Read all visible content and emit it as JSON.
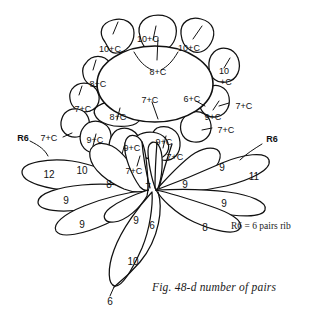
{
  "figure": {
    "caption": "Fig. 48-d number of pairs",
    "legend_note": "R6 = 6 pairs rib",
    "background_color": "#ffffff",
    "ink_color": "#111111"
  },
  "diagram": {
    "center_disc": {
      "labels": [
        {
          "id": "center-top",
          "text": "8+C"
        },
        {
          "id": "center-left-low",
          "text": "7+C"
        },
        {
          "id": "center-right-low",
          "text": "6+C"
        }
      ]
    },
    "outer_petals": [
      {
        "id": "petal-top-left",
        "text": "10+C"
      },
      {
        "id": "petal-top-center",
        "text": "10+C"
      },
      {
        "id": "petal-top-right",
        "text": "10+C"
      },
      {
        "id": "petal-right-upper",
        "text": "10\n+C"
      },
      {
        "id": "petal-left-upper",
        "text": "8+C"
      },
      {
        "id": "petal-left-mid",
        "text": "7+C"
      },
      {
        "id": "petal-left-lower",
        "text": "8+C"
      },
      {
        "id": "petal-left-edge",
        "text": "7+C"
      },
      {
        "id": "petal-bottom-left",
        "text": "9+C"
      },
      {
        "id": "petal-bottom-center-left",
        "text": "9+C"
      },
      {
        "id": "petal-bottom-center",
        "text": "7+C"
      },
      {
        "id": "petal-bottom-center-right",
        "text": "9+C"
      },
      {
        "id": "petal-bottom-right",
        "text": "7+C"
      },
      {
        "id": "petal-right-mid",
        "text": "9+C"
      },
      {
        "id": "petal-right-outer",
        "text": "7+C"
      },
      {
        "id": "petal-right-lower",
        "text": "7+C"
      }
    ],
    "leaves_left": [
      {
        "id": "leaf-left-1",
        "text": "12"
      },
      {
        "id": "leaf-left-2",
        "text": "9"
      },
      {
        "id": "leaf-left-3",
        "text": "9"
      },
      {
        "id": "leaf-left-4",
        "text": "10"
      },
      {
        "id": "leaf-left-5",
        "text": "8"
      },
      {
        "id": "leaf-left-6",
        "text": "9"
      }
    ],
    "leaves_right": [
      {
        "id": "leaf-right-1",
        "text": "9"
      },
      {
        "id": "leaf-right-2",
        "text": "11"
      },
      {
        "id": "leaf-right-3",
        "text": "9"
      },
      {
        "id": "leaf-right-4",
        "text": "9"
      },
      {
        "id": "leaf-right-5",
        "text": "8"
      }
    ],
    "stem": [
      {
        "id": "stem-upper",
        "text": "7"
      },
      {
        "id": "stem-junction",
        "text": "6"
      },
      {
        "id": "stem-leaf",
        "text": "10"
      },
      {
        "id": "stem-tip",
        "text": "6"
      }
    ],
    "rib_callouts": [
      {
        "id": "r6-left",
        "text": "R6"
      },
      {
        "id": "r6-right",
        "text": "R6"
      }
    ]
  }
}
